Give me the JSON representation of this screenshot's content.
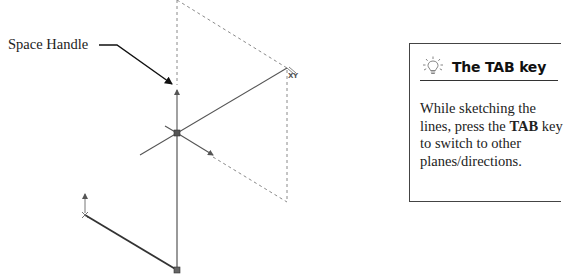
{
  "figure": {
    "callout": {
      "label": "Space Handle"
    },
    "plane_label": "XY",
    "tip_box": {
      "icon": "lightbulb-icon",
      "title": "The TAB key",
      "body_parts": [
        {
          "text": "While sketching the lines, press the ",
          "bold": false
        },
        {
          "text": "TAB",
          "bold": true
        },
        {
          "text": " key to switch to other planes/directions.",
          "bold": false
        }
      ],
      "body_1": "While sketching the lines, press the ",
      "body_bold": "TAB",
      "body_2": " key to switch to other planes/directions."
    },
    "colors": {
      "line": "#444444",
      "dashed": "#8a8a8a",
      "node": "#555555",
      "text": "#222222"
    }
  }
}
